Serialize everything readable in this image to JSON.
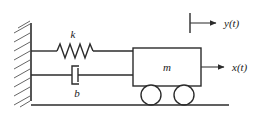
{
  "figure": {
    "domain": "Diagram",
    "background_color": "#ffffff",
    "line_color": "#2b2b2b"
  },
  "labels": {
    "spring_stiffness": "k",
    "damping_coefficient": "b",
    "mass": "m",
    "input_displacement": "y(t)",
    "output_displacement": "x(t)"
  },
  "components": {
    "wall": {
      "name": "fixed-wall",
      "hatch_count": 9
    },
    "spring": {
      "name": "spring",
      "coil_peaks": 4
    },
    "damper": {
      "name": "dashpot-damper"
    },
    "mass_block": {
      "name": "mass-block"
    },
    "wheels": {
      "name": "wheels",
      "count": 2
    },
    "ground": {
      "name": "ground-line"
    },
    "arrows": [
      {
        "name": "y-arrow",
        "label": "y(t)"
      },
      {
        "name": "x-arrow",
        "label": "x(t)"
      }
    ]
  }
}
